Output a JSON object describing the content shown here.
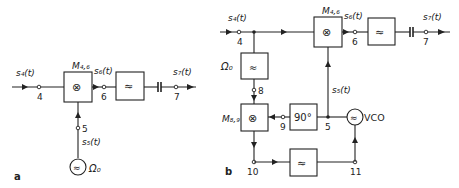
{
  "diagram_a": {
    "panel_label": "a",
    "input_signal": "s₄(t)",
    "mixer_label": "M₄,₆",
    "mixer_symbol": "⊗",
    "mixer_output_signal": "s₆(t)",
    "filter_symbol": "≈",
    "output_signal": "s₇(t)",
    "oscillator_signal": "s₅(t)",
    "oscillator_freq": "Ω₀",
    "oscillator_symbol": "≈",
    "nodes": {
      "n4": "4",
      "n5": "5",
      "n6": "6",
      "n7": "7"
    }
  },
  "diagram_b": {
    "panel_label": "b",
    "input_signal": "s₄(t)",
    "bandpass_label": "Ω₀",
    "bandpass_symbol": "≈",
    "mixer1_label": "M₄,₆",
    "mixer1_symbol": "⊗",
    "mixer1_output_signal": "s₆(t)",
    "filter_symbol": "≈",
    "output_signal": "s₇(t)",
    "vco_signal": "s₅(t)",
    "mixer2_label": "M₈,₉",
    "mixer2_symbol": "⊗",
    "phase_shifter_label": "90°",
    "loop_filter_symbol": "≈",
    "vco_label": "VCO",
    "vco_symbol": "≈",
    "nodes": {
      "n4": "4",
      "n5": "5",
      "n6": "6",
      "n7": "7",
      "n8": "8",
      "n9": "9",
      "n10": "10",
      "n11": "11"
    }
  }
}
